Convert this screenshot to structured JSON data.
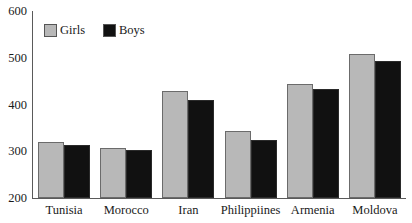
{
  "chart_data": {
    "type": "bar",
    "title": "",
    "xlabel": "",
    "ylabel": "",
    "ylim": [
      200,
      600
    ],
    "yticks": [
      200,
      300,
      400,
      500,
      600
    ],
    "grid": false,
    "legend_position": "top-left",
    "categories": [
      "Tunisia",
      "Morocco",
      "Iran",
      "Philippiines",
      "Armenia",
      "Moldova"
    ],
    "series": [
      {
        "name": "Girls",
        "color": "#b8b8b8",
        "values": [
          319,
          307,
          428,
          343,
          443,
          508
        ]
      },
      {
        "name": "Boys",
        "color": "#111111",
        "values": [
          313,
          303,
          410,
          325,
          434,
          493
        ]
      }
    ]
  },
  "axis": {
    "y_tick_labels": [
      "600",
      "500",
      "400",
      "300",
      "200"
    ]
  }
}
